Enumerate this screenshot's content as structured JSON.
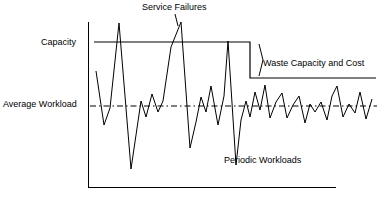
{
  "figure": {
    "title": "",
    "background": "#ffffff",
    "ink": "#000000"
  },
  "labels": {
    "service_failures": "Service Failures",
    "capacity": "Capacity",
    "waste": "Waste Capacity and Cost",
    "average_workload": "Average Workload",
    "periodic_workloads": "Periodic Workloads"
  },
  "chart_data": {
    "type": "line",
    "title": "",
    "subtitle": "",
    "xlabel": "",
    "ylabel": "",
    "grid": false,
    "legend_position": "inline-annotations",
    "xlim": [
      88,
      379
    ],
    "ylim": [
      190,
      10
    ],
    "axes": {
      "y_axis": {
        "x": 88,
        "y_top": 22,
        "y_bottom": 187
      },
      "x_axis": {
        "y": 187,
        "x_left": 88,
        "x_right": 336
      }
    },
    "annotations": [
      {
        "name": "service-failures",
        "text": "Service Failures",
        "x": 175,
        "y": 8,
        "anchor": "middle"
      },
      {
        "name": "capacity",
        "text": "Capacity",
        "x": 84,
        "y": 43,
        "anchor": "end"
      },
      {
        "name": "waste-capacity-and-cost",
        "text": "Waste Capacity and Cost",
        "x": 264,
        "y": 64,
        "anchor": "start"
      },
      {
        "name": "average-workload",
        "text": "Average Workload",
        "x": 84,
        "y": 105,
        "anchor": "end"
      },
      {
        "name": "periodic-workloads",
        "text": "Periodic Workloads",
        "x": 224,
        "y": 161,
        "anchor": "start"
      }
    ],
    "series": [
      {
        "name": "Capacity",
        "style": "step-solid",
        "color": "#000000",
        "points": [
          [
            94,
            42
          ],
          [
            250,
            42
          ],
          [
            250,
            78
          ],
          [
            376,
            78
          ]
        ]
      },
      {
        "name": "Average Workload",
        "style": "dash-dot",
        "color": "#000000",
        "points": [
          [
            90,
            106
          ],
          [
            377,
            106
          ]
        ]
      },
      {
        "name": "Periodic Workloads",
        "style": "solid",
        "color": "#000000",
        "points": [
          [
            96,
            71
          ],
          [
            104,
            125
          ],
          [
            110,
            108
          ],
          [
            119,
            23
          ],
          [
            131,
            169
          ],
          [
            141,
            101
          ],
          [
            146,
            117
          ],
          [
            152,
            94
          ],
          [
            158,
            112
          ],
          [
            163,
            101
          ],
          [
            171,
            47
          ],
          [
            181,
            22
          ],
          [
            190,
            148
          ],
          [
            196,
            122
          ],
          [
            201,
            97
          ],
          [
            206,
            112
          ],
          [
            211,
            86
          ],
          [
            218,
            125
          ],
          [
            224,
            96
          ],
          [
            228,
            41
          ],
          [
            236,
            165
          ],
          [
            241,
            120
          ],
          [
            246,
            101
          ],
          [
            250,
            117
          ],
          [
            255,
            92
          ],
          [
            260,
            110
          ],
          [
            265,
            85
          ],
          [
            270,
            118
          ],
          [
            276,
            102
          ],
          [
            282,
            93
          ],
          [
            287,
            118
          ],
          [
            293,
            105
          ],
          [
            299,
            96
          ],
          [
            305,
            123
          ],
          [
            310,
            104
          ],
          [
            315,
            112
          ],
          [
            321,
            102
          ],
          [
            327,
            120
          ],
          [
            332,
            96
          ],
          [
            337,
            86
          ],
          [
            343,
            117
          ],
          [
            349,
            104
          ],
          [
            355,
            113
          ],
          [
            360,
            92
          ],
          [
            366,
            119
          ],
          [
            372,
            99
          ]
        ]
      },
      {
        "name": "Waste Capacity Brace",
        "style": "brace",
        "color": "#000000",
        "points": [
          [
            259,
            44
          ],
          [
            261,
            52
          ],
          [
            263,
            60
          ],
          [
            261,
            68
          ],
          [
            259,
            76
          ]
        ]
      }
    ],
    "arrows": [
      {
        "name": "service-failures-pointer",
        "from": [
          175,
          14
        ],
        "to": [
          178,
          26
        ]
      }
    ]
  }
}
